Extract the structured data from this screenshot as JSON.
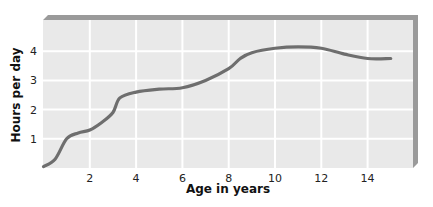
{
  "chart_data": {
    "type": "line",
    "title": "",
    "xlabel": "Age in years",
    "ylabel": "Hours per day",
    "xlim": [
      0,
      16
    ],
    "ylim": [
      0,
      5
    ],
    "x_ticks": [
      2,
      4,
      6,
      8,
      10,
      12,
      14
    ],
    "y_ticks": [
      1,
      2,
      3,
      4
    ],
    "grid": true,
    "legend": null,
    "series": [
      {
        "name": "Hours per day",
        "color": "#6e6e6e",
        "x": [
          0,
          0.5,
          1,
          1.5,
          2,
          2.5,
          3,
          3.3,
          4,
          5,
          6,
          7,
          8,
          8.5,
          9,
          10,
          11,
          12,
          13,
          14,
          15
        ],
        "y": [
          0.05,
          0.3,
          1.0,
          1.2,
          1.3,
          1.55,
          1.9,
          2.4,
          2.6,
          2.7,
          2.75,
          3.0,
          3.4,
          3.75,
          3.95,
          4.1,
          4.15,
          4.1,
          3.9,
          3.75,
          3.75
        ]
      }
    ]
  },
  "colors": {
    "plot_bg": "#e9e9e9",
    "grid": "#ffffff",
    "frame_edge": "#9a9a9a",
    "line": "#6e6e6e"
  }
}
